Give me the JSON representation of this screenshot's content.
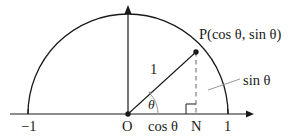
{
  "figure": {
    "type": "geometry-diagram",
    "colors": {
      "stroke": "#1a1a1a",
      "label": "#1a1a1a",
      "dashed": "#777777",
      "background": "#ffffff"
    },
    "labels": {
      "point_p": "P(cos θ, sin θ)",
      "radius": "1",
      "sine_leader": "sin θ",
      "angle": "θ",
      "axis_left_tick": "−1",
      "origin": "O",
      "cosine_segment": "cos θ",
      "foot_point": "N",
      "axis_right_tick": "1"
    },
    "elements": {
      "semicircle": "upper half unit circle",
      "x_axis": "horizontal axis with right arrowhead",
      "y_axis": "vertical axis with upward arrowhead",
      "radius_line": "segment from O to P",
      "dashed_drop": "dashed perpendicular from P to N",
      "right_angle_marker": "square at N",
      "angle_arc": "arc marking angle theta at O",
      "point_marker_p": "filled dot at P",
      "point_marker_o": "filled dot at O"
    },
    "geometry": {
      "origin": [
        128,
        114
      ],
      "radius_px": 100,
      "point_p": [
        196,
        52
      ],
      "foot_n": [
        196,
        114
      ],
      "left_end": [
        28,
        114
      ],
      "right_end": [
        228,
        114
      ],
      "top_of_circle": [
        128,
        22
      ],
      "angle_degrees": 43
    }
  }
}
